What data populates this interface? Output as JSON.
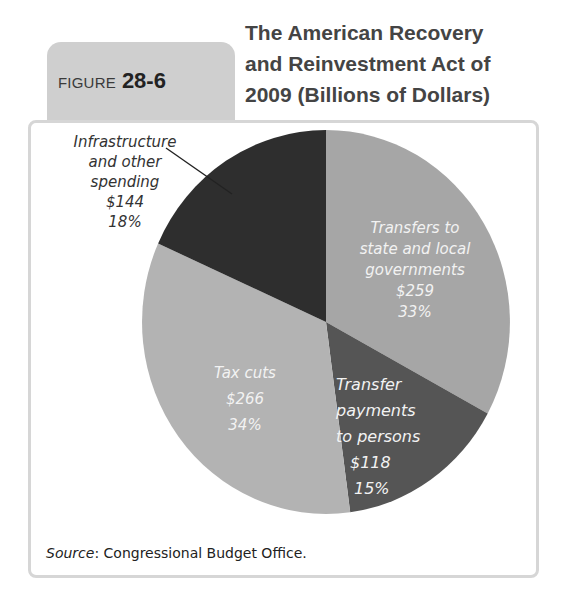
{
  "figure": {
    "label_word": "FIGURE",
    "label_number": "28-6",
    "title_lines": [
      "The American Recovery",
      "and Reinvestment Act of",
      "2009 (Billions of Dollars)"
    ]
  },
  "labels": {
    "infrastructure": [
      "Infrastructure",
      "and other",
      "spending",
      "$144",
      "18%"
    ],
    "state_local": [
      "Transfers to",
      "state and local",
      "governments",
      "$259",
      "33%"
    ],
    "persons": [
      "Transfer",
      "payments",
      "to persons",
      "$118",
      "15%"
    ],
    "tax_cuts": [
      "Tax cuts",
      "$266",
      "34%"
    ]
  },
  "source": {
    "prefix": "Source",
    "text": ": Congressional Budget Office."
  },
  "colors": {
    "state_local": "#a6a6a6",
    "persons": "#555555",
    "tax_cuts": "#b3b3b3",
    "infrastructure": "#2e2e2e",
    "tab": "#cfcfcf",
    "frame_border": "#d6d6d6"
  },
  "chart_data": {
    "type": "pie",
    "title": "The American Recovery and Reinvestment Act of 2009 (Billions of Dollars)",
    "figure_number": "28-6",
    "units": "Billions of Dollars",
    "categories": [
      "Transfers to state and local governments",
      "Transfer payments to persons",
      "Tax cuts",
      "Infrastructure and other spending"
    ],
    "values": [
      259,
      118,
      266,
      144
    ],
    "percentages": [
      33,
      15,
      34,
      18
    ],
    "source": "Congressional Budget Office",
    "legend": "none (direct labels)"
  }
}
